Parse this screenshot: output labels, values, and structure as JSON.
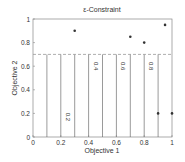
{
  "chart_data": {
    "type": "scatter",
    "title": "ε-Constraint",
    "xlabel": "Objective 1",
    "ylabel": "Objective 2",
    "xlim": [
      0,
      1
    ],
    "ylim": [
      0,
      1
    ],
    "xticks": [
      "0",
      "0.2",
      "0.4",
      "0.6",
      "0.8",
      "1"
    ],
    "yticks": [
      "0",
      "0.2",
      "0.4",
      "0.6",
      "0.8",
      "1"
    ],
    "grid": false,
    "points": [
      {
        "x": 0.3,
        "y": 0.9
      },
      {
        "x": 0.7,
        "y": 0.85
      },
      {
        "x": 0.8,
        "y": 0.8
      },
      {
        "x": 0.95,
        "y": 0.95
      },
      {
        "x": 0.9,
        "y": 0.2
      },
      {
        "x": 1.0,
        "y": 0.2
      }
    ],
    "constraint_line": {
      "y": 0.7,
      "style": "dashed"
    },
    "contour_lines_x": [
      0.1,
      0.2,
      0.3,
      0.4,
      0.5,
      0.6,
      0.7,
      0.8,
      0.9
    ],
    "contour_labels": [
      {
        "text": "0.2",
        "x": 0.2,
        "y": 0.17
      },
      {
        "text": "0.4",
        "x": 0.4,
        "y": 0.6
      },
      {
        "text": "0.6",
        "x": 0.6,
        "y": 0.6
      },
      {
        "text": "0.8",
        "x": 0.8,
        "y": 0.6
      }
    ]
  }
}
